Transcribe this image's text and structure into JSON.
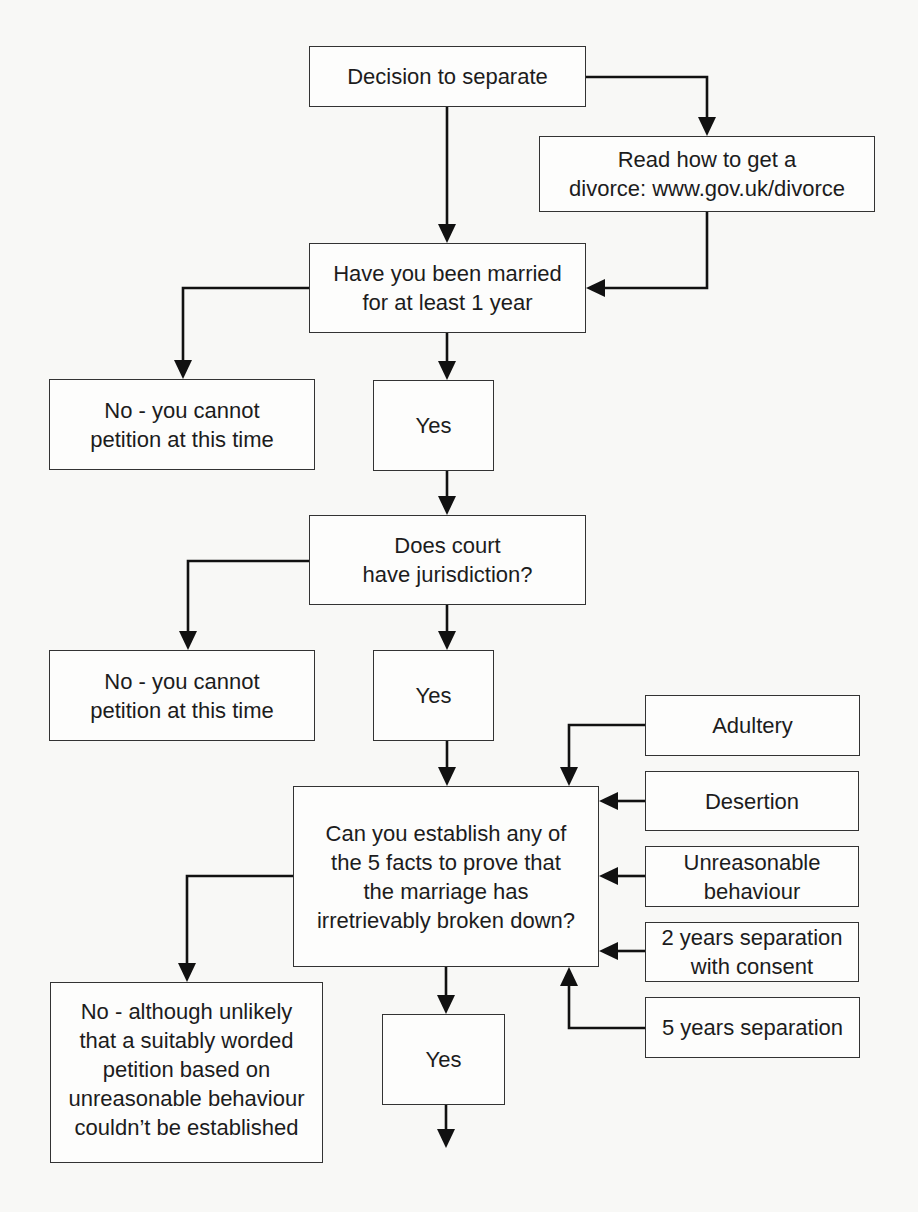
{
  "diagram": {
    "type": "flowchart",
    "nodes": {
      "start": {
        "label": "Decision to separate"
      },
      "read": {
        "label": "Read how to get a\ndivorce: www.gov.uk/divorce"
      },
      "married": {
        "label": "Have you been married\nfor at least 1 year"
      },
      "no1": {
        "label": "No - you cannot\npetition at this time"
      },
      "yes1": {
        "label": "Yes"
      },
      "court": {
        "label": "Does court\nhave jurisdiction?"
      },
      "no2": {
        "label": "No - you cannot\npetition at this time"
      },
      "yes2": {
        "label": "Yes"
      },
      "facts": {
        "label": "Can you establish any of\nthe 5 facts to prove that\nthe marriage has\nirretrievably broken down?"
      },
      "adultery": {
        "label": "Adultery"
      },
      "desertion": {
        "label": "Desertion"
      },
      "unreasonable": {
        "label": "Unreasonable\nbehaviour"
      },
      "sep2": {
        "label": "2 years separation\nwith consent"
      },
      "sep5": {
        "label": "5 years separation"
      },
      "no3": {
        "label": "No - although unlikely\nthat a suitably worded\npetition based on\nunreasonable behaviour\ncouldn’t be established"
      },
      "yes3": {
        "label": "Yes"
      }
    },
    "edges": [
      {
        "from": "start",
        "to": "married"
      },
      {
        "from": "start",
        "to": "read"
      },
      {
        "from": "read",
        "to": "married"
      },
      {
        "from": "married",
        "to": "no1"
      },
      {
        "from": "married",
        "to": "yes1"
      },
      {
        "from": "yes1",
        "to": "court"
      },
      {
        "from": "court",
        "to": "no2"
      },
      {
        "from": "court",
        "to": "yes2"
      },
      {
        "from": "yes2",
        "to": "facts"
      },
      {
        "from": "adultery",
        "to": "facts"
      },
      {
        "from": "desertion",
        "to": "facts"
      },
      {
        "from": "unreasonable",
        "to": "facts"
      },
      {
        "from": "sep2",
        "to": "facts"
      },
      {
        "from": "sep5",
        "to": "facts"
      },
      {
        "from": "facts",
        "to": "no3"
      },
      {
        "from": "facts",
        "to": "yes3"
      },
      {
        "from": "yes3",
        "to": "continues-below"
      }
    ]
  },
  "colors": {
    "line": "#111111",
    "box_border": "#333333",
    "background": "#f8f8f6"
  }
}
